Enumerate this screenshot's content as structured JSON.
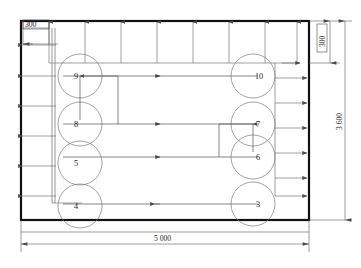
{
  "drawing": {
    "title": "Floor plan with circular elements",
    "background_color": "#ffffff",
    "line_color": "#6e6e6e",
    "wall_color": "#111111"
  },
  "dimensions": {
    "top_left_offset": "300",
    "right_top_offset": "300",
    "right_height": "3 600",
    "bottom_width": "5 000"
  },
  "circles_left": [
    {
      "label": "9"
    },
    {
      "label": "8"
    },
    {
      "label": "5"
    },
    {
      "label": "4"
    }
  ],
  "circles_right": [
    {
      "label": "10"
    },
    {
      "label": "7"
    },
    {
      "label": "6"
    },
    {
      "label": "3"
    }
  ],
  "annotations": {
    "top_arrow_count": 8,
    "left_arrow_count": 6,
    "right_arrow_count": 6,
    "flow_arrow_count": 4
  }
}
